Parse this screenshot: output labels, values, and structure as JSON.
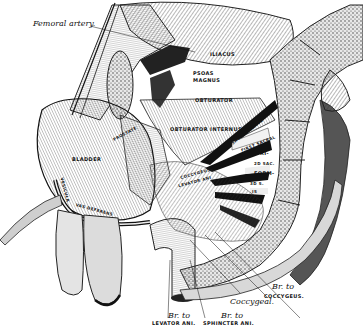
{
  "figure": {
    "colors": {
      "ink": "#111111",
      "paper": "#ffffff",
      "shade": "#555555",
      "bone": "#cfcfcf"
    }
  },
  "labels": {
    "femoral_artery": "Femoral artery.",
    "iliacus": "ILIACUS",
    "psoas_magnus": "PSOAS\nMAGNUS",
    "psoas": "PSOAS",
    "magnus": "MAGNUS",
    "obturator": "OBTURATOR",
    "obturator_internus": "OBTURATOR INTERNUS",
    "bladder": "BLADDER",
    "prostate": "PROSTATE",
    "vas_deferens": "VAS DEFERENS",
    "vesicula": "VESICULA",
    "first_sacral": "FIRST SACRAL",
    "second_sacral_nerve": "SACRAL NERVE",
    "pyri": "PYRI-",
    "second_sac": "2D SAC.",
    "form": "FORM-",
    "third_s": "3D S.",
    "is": "IS",
    "coccygeus_levator": "COCCYGEUS",
    "levator_ani_arch": "LEVATOR ANI",
    "br_to_coccygeus_br": "Br. to",
    "br_to_coccygeus": "COCCYGEUS.",
    "coccygeal": "Coccygeal.",
    "br_to_levator_br": "Br. to",
    "br_to_levator": "LEVATOR ANI.",
    "br_to_sphincter_br": "Br. to",
    "br_to_sphincter": "SPHINCTER ANI."
  }
}
